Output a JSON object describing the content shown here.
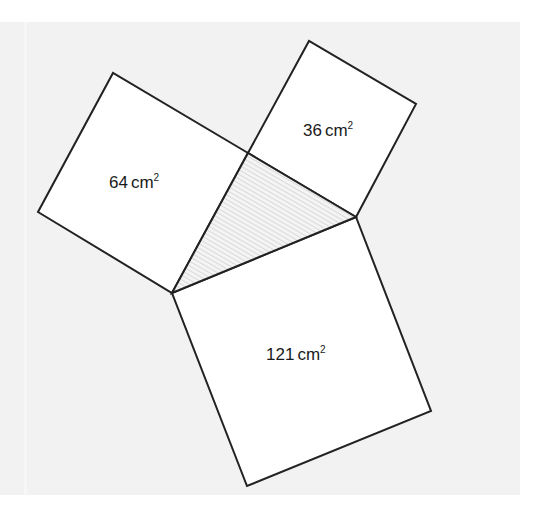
{
  "diagram": {
    "colors": {
      "background_panel": "#f2f2f2",
      "square_fill": "#ffffff",
      "outline": "#222222",
      "triangle_hatch": "#c8c8c8",
      "triangle_fill": "#f4f4f4",
      "label": "#1a1a1a"
    },
    "triangle": {
      "shaded": true,
      "vertices": [
        [
          248,
          153
        ],
        [
          356,
          217
        ],
        [
          172,
          293
        ]
      ]
    },
    "squares": [
      {
        "name": "square-64",
        "area_value": "64",
        "unit": "cm",
        "exponent": "2",
        "points": [
          [
            172,
            293
          ],
          [
            248,
            153
          ],
          [
            113,
            73
          ],
          [
            38,
            212
          ]
        ],
        "label_pos": [
          109,
          188
        ]
      },
      {
        "name": "square-36",
        "area_value": "36",
        "unit": "cm",
        "exponent": "2",
        "points": [
          [
            248,
            153
          ],
          [
            309,
            41
          ],
          [
            416,
            104
          ],
          [
            356,
            217
          ]
        ],
        "label_pos": [
          303,
          136
        ]
      },
      {
        "name": "square-121",
        "area_value": "121",
        "unit": "cm",
        "exponent": "2",
        "points": [
          [
            172,
            293
          ],
          [
            356,
            217
          ],
          [
            431,
            411
          ],
          [
            247,
            486
          ]
        ],
        "label_pos": [
          266,
          360
        ]
      }
    ]
  }
}
